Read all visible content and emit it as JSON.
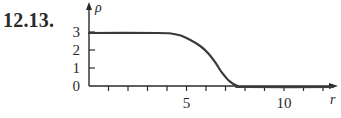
{
  "figure": {
    "label": "12.13."
  },
  "chart_data": {
    "type": "line",
    "title": "",
    "xlabel": "r",
    "ylabel": "ρ",
    "xlim": [
      0,
      12.6
    ],
    "ylim": [
      0,
      3.2
    ],
    "x_ticks": [
      1,
      2,
      3,
      4,
      5,
      6,
      7,
      8,
      9,
      10,
      11,
      12
    ],
    "x_tick_labels": [
      {
        "value": 5,
        "label": "5"
      },
      {
        "value": 10,
        "label": "10"
      }
    ],
    "y_ticks": [
      0,
      1,
      2,
      3
    ],
    "y_tick_labels": [
      {
        "value": 0,
        "label": "0"
      },
      {
        "value": 1,
        "label": "1"
      },
      {
        "value": 2,
        "label": "2"
      },
      {
        "value": 3,
        "label": "3"
      }
    ],
    "grid": false,
    "legend": null,
    "series": [
      {
        "name": "ρ(r)",
        "x": [
          0,
          3.5,
          4.2,
          4.7,
          5.2,
          5.7,
          6.1,
          6.5,
          6.8,
          7.2,
          7.6,
          8.0,
          12.5
        ],
        "values": [
          3.0,
          3.0,
          2.97,
          2.86,
          2.61,
          2.28,
          1.89,
          1.33,
          0.83,
          0.33,
          0.06,
          0.0,
          0.0
        ]
      }
    ]
  },
  "colors": {
    "ink": "#2a2a2a",
    "curve": "#3a3a3a",
    "background": "#ffffff"
  }
}
